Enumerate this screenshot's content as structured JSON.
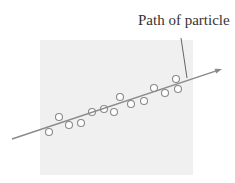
{
  "diagram": {
    "label": "Path of particle",
    "colors": {
      "background_panel": "#f0f0f0",
      "line": "#8a8a8a",
      "circle_stroke": "#8a8a8a",
      "text": "#333333"
    },
    "panel": {
      "x": 40,
      "y": 40,
      "w": 153,
      "h": 135
    },
    "path_line": {
      "x1": 12,
      "y1": 139,
      "x2": 222,
      "y2": 69
    },
    "leader_line": {
      "x1": 181,
      "y1": 38,
      "x2": 187,
      "y2": 78
    },
    "circles": [
      {
        "x": 49,
        "y": 132
      },
      {
        "x": 59,
        "y": 117
      },
      {
        "x": 69,
        "y": 125
      },
      {
        "x": 81,
        "y": 123
      },
      {
        "x": 92,
        "y": 112
      },
      {
        "x": 104,
        "y": 109
      },
      {
        "x": 114,
        "y": 112
      },
      {
        "x": 120,
        "y": 97
      },
      {
        "x": 131,
        "y": 104
      },
      {
        "x": 144,
        "y": 101
      },
      {
        "x": 154,
        "y": 88
      },
      {
        "x": 165,
        "y": 93
      },
      {
        "x": 176,
        "y": 79
      },
      {
        "x": 178,
        "y": 89
      }
    ]
  }
}
